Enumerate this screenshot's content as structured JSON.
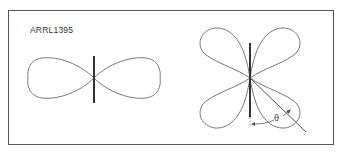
{
  "figure": {
    "label": "ARRL1395",
    "left_pattern": {
      "description": "figure-eight radiation pattern (half-wave dipole)",
      "lobes": 2,
      "center": [
        94,
        78
      ]
    },
    "right_pattern": {
      "description": "four-lobe radiation pattern (longer antenna)",
      "lobes": 4,
      "center": [
        250,
        78
      ],
      "angle_symbol": "θ"
    },
    "colors": {
      "frame": "#555555",
      "pattern": "#666666",
      "antenna": "#333333",
      "text": "#333333"
    }
  }
}
